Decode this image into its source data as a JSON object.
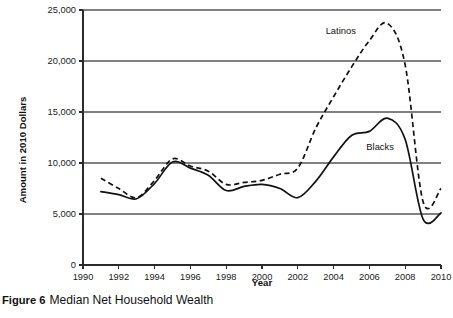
{
  "caption": {
    "label": "Figure 6",
    "text": "Median Net Household Wealth"
  },
  "chart_data": {
    "type": "line",
    "title": "Median Net Household Wealth",
    "xlabel": "Year",
    "ylabel": "Amount in 2010 Dollars",
    "xlim": [
      1990,
      2010
    ],
    "ylim": [
      0,
      25000
    ],
    "xticks": [
      1990,
      1992,
      1994,
      1996,
      1998,
      2000,
      2002,
      2004,
      2006,
      2008,
      2010
    ],
    "xtick_labels": [
      "1990",
      "1992",
      "1994",
      "1996",
      "1998",
      "2000",
      "2002",
      "2004",
      "2006",
      "2008",
      "2010"
    ],
    "yticks": [
      0,
      5000,
      10000,
      15000,
      20000,
      25000
    ],
    "ytick_labels": [
      "0",
      "5,000",
      "10,000",
      "15,000",
      "20,000",
      "25,000"
    ],
    "grid": "horizontal",
    "legend": "inline-annotations",
    "x": [
      1991,
      1992,
      1993,
      1994,
      1995,
      1996,
      1997,
      1998,
      1999,
      2000,
      2001,
      2002,
      2003,
      2004,
      2005,
      2006,
      2007,
      2008,
      2009,
      2010
    ],
    "series": [
      {
        "name": "Latinos",
        "style": "dashed",
        "color": "#111111",
        "label_x": 2004.4,
        "label_y": 22600,
        "values": [
          8500,
          7500,
          6600,
          8300,
          10400,
          9700,
          9200,
          7900,
          8100,
          8300,
          8900,
          9500,
          13400,
          16500,
          19400,
          22000,
          23700,
          19600,
          6200,
          7500
        ]
      },
      {
        "name": "Blacks",
        "style": "solid",
        "color": "#111111",
        "label_x": 2006.6,
        "label_y": 11300,
        "values": [
          7200,
          6900,
          6500,
          8000,
          10100,
          9500,
          8800,
          7300,
          7700,
          7900,
          7500,
          6600,
          8200,
          10600,
          12700,
          13100,
          14400,
          12300,
          4500,
          5100
        ]
      }
    ],
    "annotations": [
      {
        "text": "Latinos",
        "x": 2004.4,
        "y": 22600
      },
      {
        "text": "Blacks",
        "x": 2006.6,
        "y": 11300
      }
    ]
  }
}
